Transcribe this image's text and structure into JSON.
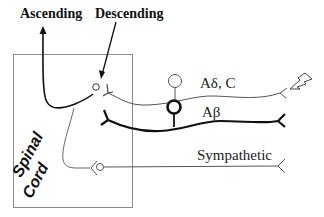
{
  "diagram": {
    "labels": {
      "ascending": "Ascending",
      "descending": "Descending",
      "spinal": "Spinal",
      "cord": "Cord",
      "a_delta_c": "Aδ, C",
      "a_beta": "Aβ",
      "sympathetic": "Sympathetic"
    },
    "colors": {
      "box": "#8a8a8a",
      "thin_fiber": "#555555",
      "thick_fiber": "#111111",
      "text": "#222222"
    }
  }
}
